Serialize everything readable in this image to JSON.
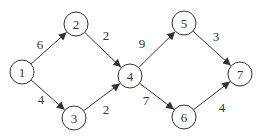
{
  "graph": {
    "type": "directed-weighted",
    "nodes": [
      {
        "id": "1",
        "label": "1"
      },
      {
        "id": "2",
        "label": "2"
      },
      {
        "id": "3",
        "label": "3"
      },
      {
        "id": "4",
        "label": "4"
      },
      {
        "id": "5",
        "label": "5"
      },
      {
        "id": "6",
        "label": "6"
      },
      {
        "id": "7",
        "label": "7"
      }
    ],
    "edges": [
      {
        "from": "1",
        "to": "2",
        "weight": "6"
      },
      {
        "from": "1",
        "to": "3",
        "weight": "4"
      },
      {
        "from": "2",
        "to": "4",
        "weight": "2"
      },
      {
        "from": "3",
        "to": "4",
        "weight": "2"
      },
      {
        "from": "4",
        "to": "5",
        "weight": "9"
      },
      {
        "from": "4",
        "to": "6",
        "weight": "7"
      },
      {
        "from": "5",
        "to": "7",
        "weight": "3"
      },
      {
        "from": "6",
        "to": "7",
        "weight": "4"
      }
    ],
    "colors": {
      "stroke": "#333333",
      "fill": "#ffffff"
    }
  }
}
